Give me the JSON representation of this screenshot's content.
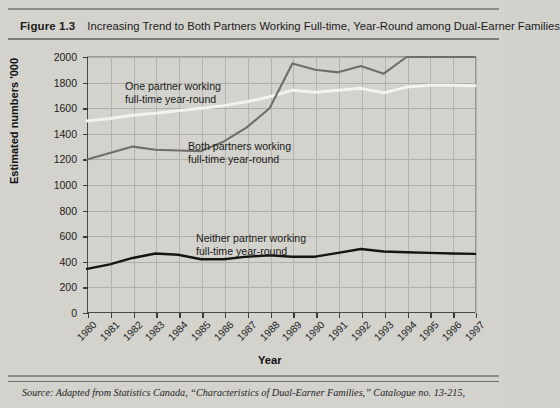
{
  "header": {
    "figure_number": "Figure 1.3",
    "title": "Increasing Trend to Both Partners Working Full-time, Year-Round among Dual-Earner Families"
  },
  "footer": {
    "source": "Source: Adapted from Statistics Canada, “Characteristics of Dual-Earner Families,” Catalogue no. 13-215,"
  },
  "colors": {
    "background": "#d3d2cd",
    "one_partner_line": "#f2f2ee",
    "both_partners_line": "#6e6e6b",
    "neither_partner_line": "#141414",
    "axis": "#4a4a48",
    "grid": "#b0b0ab"
  },
  "chart_data": {
    "type": "line",
    "title": "Increasing Trend to Both Partners Working Full-time, Year-Round among Dual-Earner Families",
    "xlabel": "Year",
    "ylabel": "Estimated numbers '000",
    "xlim": [
      1980,
      1997
    ],
    "ylim": [
      0,
      2000
    ],
    "ytick_labels": [
      "2000",
      "1800",
      "1600",
      "1400",
      "1200",
      "1000",
      "800",
      "600",
      "400",
      "200",
      "0"
    ],
    "ytick_values": [
      2000,
      1800,
      1600,
      1400,
      1200,
      1000,
      800,
      600,
      400,
      200,
      0
    ],
    "categories": [
      "1980",
      "1981",
      "1982",
      "1983",
      "1984",
      "1985",
      "1986",
      "1987",
      "1988",
      "1989",
      "1990",
      "1991",
      "1992",
      "1993",
      "1994",
      "1995",
      "1996",
      "1997"
    ],
    "grid": true,
    "legend_position": "inline-annotations",
    "series": [
      {
        "name": "One partner working full-time year-round",
        "color": "#f2f2ee",
        "values": [
          1500,
          1520,
          1545,
          1560,
          1580,
          1600,
          1620,
          1650,
          1690,
          1740,
          1725,
          1740,
          1755,
          1720,
          1765,
          1780,
          1780,
          1775
        ],
        "annotation": "One partner working\nfull-time year-round"
      },
      {
        "name": "Both partners working full-time year-round",
        "color": "#6e6e6b",
        "values": [
          1200,
          1250,
          1300,
          1275,
          1270,
          1265,
          1340,
          1450,
          1600,
          1950,
          1900,
          1880,
          1930,
          1870,
          2000,
          2000,
          2000,
          2000
        ],
        "annotation": "Both partners working\nfull-time year-round"
      },
      {
        "name": "Neither partner working full-time year-round",
        "color": "#141414",
        "values": [
          345,
          380,
          430,
          465,
          455,
          420,
          420,
          440,
          450,
          440,
          440,
          470,
          500,
          480,
          475,
          470,
          465,
          462
        ],
        "annotation": "Neither partner working\nfull-time year-round"
      }
    ]
  }
}
